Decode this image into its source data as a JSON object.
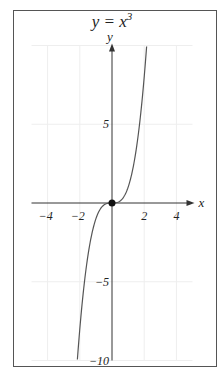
{
  "chart_data": {
    "type": "line",
    "title": "y = x",
    "title_superscript": "3",
    "function": "y = x^3",
    "xlabel": "x",
    "ylabel": "y",
    "xlim": [
      -5,
      5
    ],
    "ylim": [
      -10,
      10
    ],
    "x_ticks": [
      -4,
      -2,
      2,
      4
    ],
    "x_tick_labels": [
      "−4",
      "−2",
      "2",
      "4"
    ],
    "y_ticks": [
      5,
      -5,
      -10
    ],
    "y_tick_labels": [
      "5",
      "−5",
      "−10"
    ],
    "grid": true,
    "legend": null,
    "highlighted_point": {
      "x": 0,
      "y": 0,
      "label": "origin"
    },
    "series": [
      {
        "name": "y = x^3",
        "x": [
          -2.15,
          -2.0,
          -1.75,
          -1.5,
          -1.25,
          -1.0,
          -0.75,
          -0.5,
          -0.25,
          0,
          0.25,
          0.5,
          0.75,
          1.0,
          1.25,
          1.5,
          1.75,
          2.0,
          2.15
        ],
        "y": [
          -9.94,
          -8.0,
          -5.36,
          -3.375,
          -1.953,
          -1.0,
          -0.422,
          -0.125,
          -0.016,
          0,
          0.016,
          0.125,
          0.422,
          1.0,
          1.953,
          3.375,
          5.36,
          8.0,
          9.94
        ],
        "color": "#555555"
      }
    ]
  },
  "colors": {
    "frame": "#555555",
    "axis": "#333333",
    "grid": "#eeeeee",
    "curve": "#555555",
    "point": "#111111"
  }
}
